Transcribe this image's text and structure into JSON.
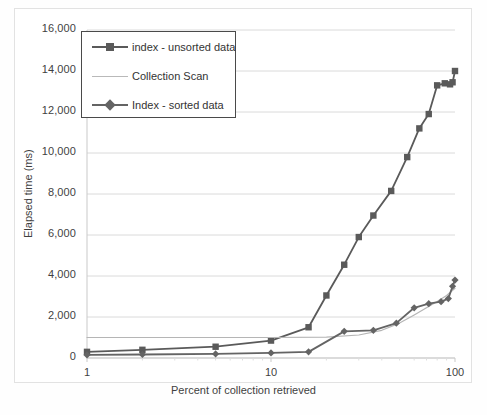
{
  "chart_data": {
    "type": "line",
    "title": "",
    "xlabel": "Percent of collection retrieved",
    "ylabel": "Elapsed time (ms)",
    "xscale": "log",
    "xlim": [
      1,
      100
    ],
    "ylim": [
      0,
      16000
    ],
    "xticks": [
      "1",
      "10",
      "100"
    ],
    "xtick_values": [
      1,
      10,
      100
    ],
    "yticks": [
      "0",
      "2,000",
      "4,000",
      "6,000",
      "8,000",
      "10,000",
      "12,000",
      "14,000",
      "16,000"
    ],
    "ytick_values": [
      0,
      2000,
      4000,
      6000,
      8000,
      10000,
      12000,
      14000,
      16000
    ],
    "grid": "horizontal",
    "legend_position": "upper-left",
    "series": [
      {
        "name": "index - unsorted data",
        "marker": "square",
        "color": "#5a5a5a",
        "x": [
          1,
          2,
          5,
          10,
          16,
          20,
          25,
          30,
          36,
          45,
          55,
          64,
          72,
          80,
          88,
          94,
          97,
          100
        ],
        "y": [
          300,
          400,
          550,
          850,
          1500,
          3050,
          4550,
          5900,
          6950,
          8150,
          9800,
          11200,
          11900,
          13300,
          13400,
          13350,
          13450,
          14000
        ]
      },
      {
        "name": "Collection Scan",
        "marker": "none",
        "color": "#b5b5b5",
        "x": [
          1,
          5,
          10,
          20,
          30,
          40,
          50,
          60,
          70,
          80,
          90,
          100
        ],
        "y": [
          1000,
          1000,
          1000,
          1020,
          1120,
          1350,
          1700,
          2100,
          2450,
          2750,
          3050,
          3400
        ]
      },
      {
        "name": "Index - sorted data",
        "marker": "diamond",
        "color": "#646464",
        "x": [
          1,
          2,
          5,
          10,
          16,
          25,
          36,
          48,
          60,
          72,
          84,
          92,
          97,
          100
        ],
        "y": [
          150,
          170,
          200,
          250,
          300,
          1300,
          1350,
          1700,
          2450,
          2650,
          2750,
          2900,
          3500,
          3800
        ]
      }
    ]
  },
  "legend": {
    "items": [
      {
        "label": "index - unsorted data",
        "marker": "square"
      },
      {
        "label": "Collection Scan",
        "marker": "line"
      },
      {
        "label": "Index - sorted data",
        "marker": "diamond"
      }
    ]
  },
  "colors": {
    "series_unsorted": "#5a5a5a",
    "series_scan": "#b5b5b5",
    "series_sorted": "#646464",
    "grid": "#dadada",
    "axis": "#c9c9c9",
    "text": "#3f3f3f"
  }
}
